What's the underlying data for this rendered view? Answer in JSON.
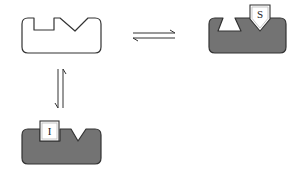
{
  "diagram": {
    "type": "enzyme-binding-equilibrium",
    "colors": {
      "outline": "#333333",
      "free_fill": "#ffffff",
      "bound_fill": "#737373",
      "label_box_fill": "#ffffff",
      "label_box_inner": "#bbbbbb",
      "arrow": "#333333"
    },
    "nodes": [
      {
        "id": "free-enzyme",
        "description": "Unbound receptor with rectangular pocket and V-shaped pocket",
        "fill": "white"
      },
      {
        "id": "enzyme-substrate-complex",
        "description": "Gray receptor with trapezoid pocket empty and pentagon ligand S bound in V pocket",
        "ligand_label": "S"
      },
      {
        "id": "enzyme-inhibitor-complex",
        "description": "Gray receptor with square ligand I bound in rectangular pocket",
        "ligand_label": "I"
      }
    ],
    "edges": [
      {
        "from": "free-enzyme",
        "to": "enzyme-substrate-complex",
        "type": "reversible",
        "orientation": "horizontal"
      },
      {
        "from": "free-enzyme",
        "to": "enzyme-inhibitor-complex",
        "type": "reversible",
        "orientation": "vertical"
      }
    ]
  }
}
